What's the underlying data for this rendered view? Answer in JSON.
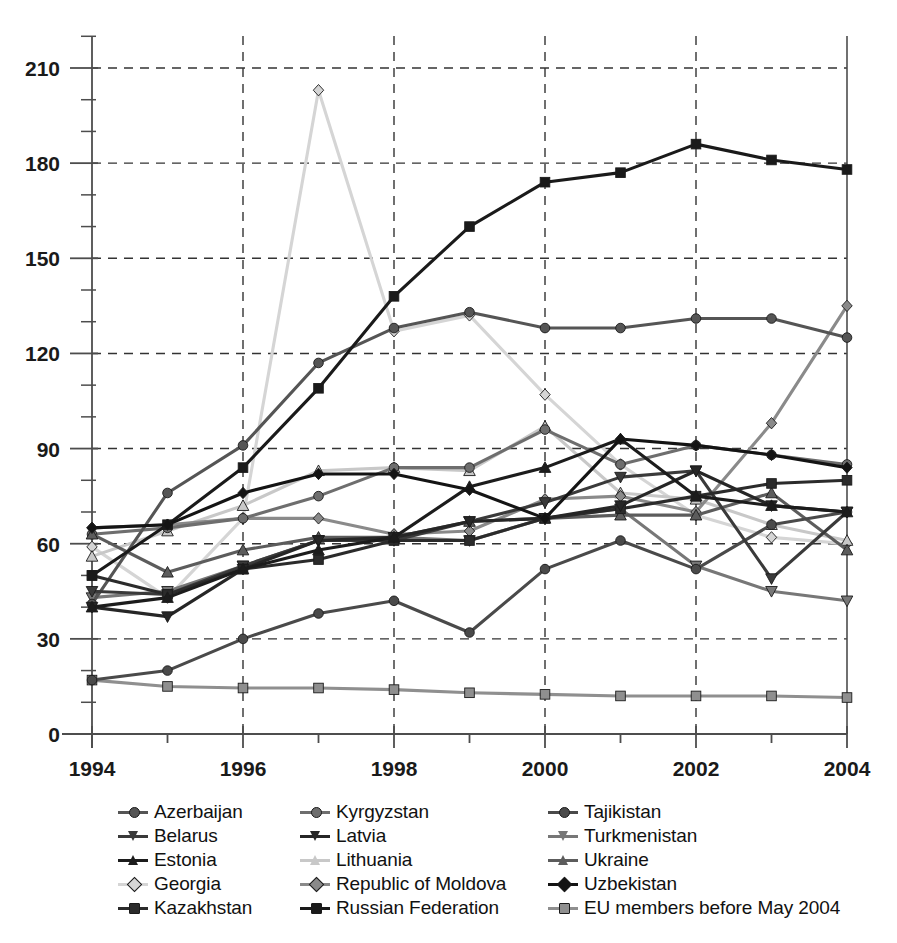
{
  "chart_data": {
    "type": "line",
    "title": "",
    "xlabel": "",
    "ylabel": "",
    "x": [
      1994,
      1995,
      1996,
      1997,
      1998,
      1999,
      2000,
      2001,
      2002,
      2003,
      2004
    ],
    "xlim": [
      1994,
      2004
    ],
    "ylim": [
      0,
      220
    ],
    "yticks": [
      0,
      30,
      60,
      90,
      120,
      150,
      180,
      210
    ],
    "ytick_labels": [
      "0",
      "30",
      "60",
      "90",
      "120",
      "150",
      "180",
      "210"
    ],
    "y_minor_step": 10,
    "xticks": [
      1994,
      1995,
      1996,
      1997,
      1998,
      1999,
      2000,
      2001,
      2002,
      2003,
      2004
    ],
    "xtick_labels": [
      "1994",
      "",
      "1996",
      "",
      "1998",
      "",
      "2000",
      "",
      "2002",
      "",
      "2004"
    ],
    "grid": "dashed-both",
    "legend_position": "below-center",
    "legend_columns": 3,
    "series": [
      {
        "name": "Azerbaijan",
        "marker": "circle",
        "color": "#555555",
        "values": [
          41,
          76,
          91,
          117,
          128,
          133,
          128,
          128,
          131,
          131,
          125
        ]
      },
      {
        "name": "Belarus",
        "marker": "triangle-down",
        "color": "#3a3a3a",
        "values": [
          45,
          44,
          53,
          61,
          61,
          67,
          73,
          81,
          83,
          49,
          70
        ]
      },
      {
        "name": "Estonia",
        "marker": "triangle-up",
        "color": "#1c1c1c",
        "values": [
          40,
          43,
          52,
          58,
          62,
          78,
          84,
          93,
          75,
          72,
          70
        ]
      },
      {
        "name": "Georgia",
        "marker": "diamond",
        "color": "#d5d5d5",
        "values": [
          59,
          43,
          68,
          203,
          127,
          132,
          107,
          85,
          69,
          62,
          60
        ]
      },
      {
        "name": "Kazakhstan",
        "marker": "square",
        "color": "#2b2b2b",
        "values": [
          50,
          44,
          52,
          55,
          61,
          61,
          68,
          71,
          75,
          79,
          80
        ]
      },
      {
        "name": "Kyrgyzstan",
        "marker": "circle",
        "color": "#6e6e6e",
        "values": [
          63,
          65,
          68,
          75,
          84,
          84,
          96,
          85,
          91,
          88,
          85
        ]
      },
      {
        "name": "Latvia",
        "marker": "triangle-down",
        "color": "#262626",
        "values": [
          40,
          37,
          52,
          61,
          62,
          67,
          68,
          72,
          83,
          72,
          70
        ]
      },
      {
        "name": "Lithuania",
        "marker": "triangle-up",
        "color": "#c8c8c8",
        "values": [
          56,
          64,
          72,
          83,
          84,
          83,
          97,
          76,
          74,
          66,
          61
        ]
      },
      {
        "name": "Republic of Moldova",
        "marker": "diamond",
        "color": "#8a8a8a",
        "values": [
          65,
          66,
          68,
          68,
          63,
          64,
          74,
          75,
          70,
          98,
          135
        ]
      },
      {
        "name": "Russian Federation",
        "marker": "square",
        "color": "#1a1a1a",
        "values": [
          50,
          66,
          84,
          109,
          138,
          160,
          174,
          177,
          186,
          181,
          178
        ]
      },
      {
        "name": "Tajikistan",
        "marker": "circle",
        "color": "#4a4a4a",
        "values": [
          17,
          20,
          30,
          38,
          42,
          32,
          52,
          61,
          52,
          66,
          70
        ]
      },
      {
        "name": "Turkmenistan",
        "marker": "triangle-down",
        "color": "#777777",
        "values": [
          43,
          45,
          53,
          61,
          62,
          61,
          68,
          71,
          53,
          45,
          42
        ]
      },
      {
        "name": "Ukraine",
        "marker": "triangle-up",
        "color": "#5c5c5c",
        "values": [
          63,
          51,
          58,
          62,
          62,
          67,
          68,
          69,
          69,
          76,
          58
        ]
      },
      {
        "name": "Uzbekistan",
        "marker": "diamond",
        "color": "#141414",
        "values": [
          65,
          66,
          76,
          82,
          82,
          77,
          68,
          93,
          91,
          88,
          84
        ]
      },
      {
        "name": "EU members before May 2004",
        "marker": "square",
        "color": "#8f8f8f",
        "values": [
          17,
          15,
          14.5,
          14.5,
          14,
          13,
          12.5,
          12,
          12,
          12,
          11.5
        ]
      }
    ]
  },
  "legend": {
    "columns": [
      {
        "items": [
          {
            "label": "Azerbaijan",
            "marker": "circle",
            "color": "#555555"
          },
          {
            "label": "Belarus",
            "marker": "triangle-down",
            "color": "#3a3a3a"
          },
          {
            "label": "Estonia",
            "marker": "triangle-up",
            "color": "#1c1c1c"
          },
          {
            "label": "Georgia",
            "marker": "diamond",
            "color": "#d5d5d5"
          },
          {
            "label": "Kazakhstan",
            "marker": "square",
            "color": "#2b2b2b"
          }
        ]
      },
      {
        "items": [
          {
            "label": "Kyrgyzstan",
            "marker": "circle",
            "color": "#6e6e6e"
          },
          {
            "label": "Latvia",
            "marker": "triangle-down",
            "color": "#262626"
          },
          {
            "label": "Lithuania",
            "marker": "triangle-up",
            "color": "#c8c8c8"
          },
          {
            "label": "Republic of Moldova",
            "marker": "diamond",
            "color": "#8a8a8a"
          },
          {
            "label": "Russian Federation",
            "marker": "square",
            "color": "#1a1a1a"
          }
        ]
      },
      {
        "items": [
          {
            "label": "Tajikistan",
            "marker": "circle",
            "color": "#4a4a4a"
          },
          {
            "label": "Turkmenistan",
            "marker": "triangle-down",
            "color": "#777777"
          },
          {
            "label": "Ukraine",
            "marker": "triangle-up",
            "color": "#5c5c5c"
          },
          {
            "label": "Uzbekistan",
            "marker": "diamond",
            "color": "#141414"
          },
          {
            "label": "EU members before May 2004",
            "marker": "square",
            "color": "#8f8f8f"
          }
        ]
      }
    ]
  },
  "axes": {
    "axis_color": "#4d4d4d",
    "grid_color": "#333333"
  }
}
